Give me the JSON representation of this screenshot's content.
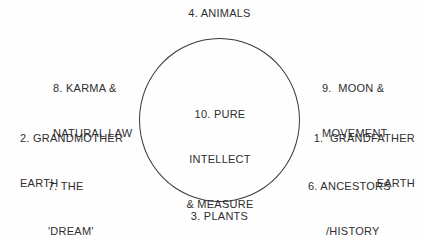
{
  "colors": {
    "background": "#fefefe",
    "text": "#2f2f2f",
    "circle_outline": "#3a3a3a"
  },
  "labels": {
    "animals": {
      "text": "4. ANIMALS"
    },
    "karma_natural_law": {
      "line1": "8. KARMA &",
      "line2": "NATURAL LAW"
    },
    "moon_movement": {
      "line1": "9.  MOON &",
      "line2": "MOVEMENT"
    },
    "grandmother_earth": {
      "line1": "2. GRANDMOTHER",
      "line2": "EARTH"
    },
    "grandfather_earth": {
      "line1": "1.  GRANDFATHER",
      "line2": "EARTH"
    },
    "the_dream": {
      "line1": "7. THE",
      "line2": "'DREAM'"
    },
    "ancestors_history": {
      "line1": "6. ANCESTORS",
      "line2": "/HISTORY"
    },
    "plants": {
      "text": "3. PLANTS"
    },
    "pure_intellect_measure": {
      "line1": "10. PURE",
      "line2": "INTELLECT",
      "line3": "& MEASURE"
    },
    "humans": {
      "text": "5. HUMANS"
    }
  }
}
